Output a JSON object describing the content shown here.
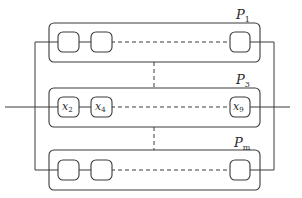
{
  "diagram": {
    "title": "",
    "processes": [
      {
        "id": "P1",
        "label_main": "P",
        "label_sub": "1",
        "nodes": [
          {
            "label_main": "",
            "label_sub": ""
          },
          {
            "label_main": "",
            "label_sub": ""
          },
          {
            "label_main": "",
            "label_sub": ""
          }
        ]
      },
      {
        "id": "P3",
        "label_main": "P",
        "label_sub": "3",
        "nodes": [
          {
            "label_main": "x",
            "label_sub": "2"
          },
          {
            "label_main": "x",
            "label_sub": "4"
          },
          {
            "label_main": "x",
            "label_sub": "9"
          }
        ]
      },
      {
        "id": "Pm",
        "label_main": "P",
        "label_sub": "m",
        "nodes": [
          {
            "label_main": "",
            "label_sub": ""
          },
          {
            "label_main": "",
            "label_sub": ""
          },
          {
            "label_main": "",
            "label_sub": ""
          }
        ]
      }
    ],
    "connections": [
      "P1 left terminal connected to Pm left terminal",
      "P1 right terminal connected to Pm right terminal",
      "P3 input enters from left, output exits to right",
      "dashed continuation between node 2 and node 3 in each process",
      "dashed vertical ellipsis between processes"
    ]
  }
}
